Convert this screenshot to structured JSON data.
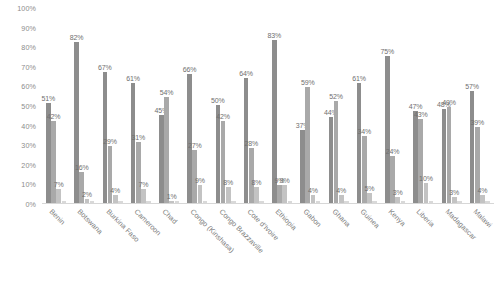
{
  "chart_data": {
    "type": "bar",
    "title": "",
    "subtitle": "",
    "xlabel": "",
    "ylabel": "",
    "ylim": [
      0,
      100
    ],
    "yticks": [
      "0%",
      "10%",
      "20%",
      "30%",
      "40%",
      "50%",
      "60%",
      "70%",
      "80%",
      "90%",
      "100%"
    ],
    "ytick_values": [
      0,
      10,
      20,
      30,
      40,
      50,
      60,
      70,
      80,
      90,
      100
    ],
    "grid": false,
    "legend": "none",
    "value_labels": true,
    "value_label_suffix": "%",
    "categories": [
      "Benin",
      "Botswana",
      "Burkina Faso",
      "Cameroon",
      "Chad",
      "Congo (Kinshasa)",
      "Congo Brazzaville",
      "Cote d'Ivoire",
      "Ethiopia",
      "Gabon",
      "Ghana",
      "Guinea",
      "Kenya",
      "Liberia",
      "Madagascar",
      "Malawi"
    ],
    "series": [
      {
        "name": "Series 1",
        "color": "#8d8d8d",
        "values": [
          51,
          82,
          67,
          61,
          45,
          66,
          50,
          64,
          83,
          37,
          44,
          61,
          75,
          47,
          48,
          57
        ],
        "labels": [
          "51%",
          "82%",
          "67%",
          "61%",
          "45%",
          "66%",
          "50%",
          "64%",
          "83%",
          "37%",
          "44%",
          "61%",
          "75%",
          "47%",
          "48%",
          "57%"
        ]
      },
      {
        "name": "Series 2",
        "color": "#a9a9a9",
        "values": [
          42,
          16,
          29,
          31,
          54,
          27,
          42,
          28,
          9,
          59,
          52,
          34,
          24,
          43,
          49,
          39
        ],
        "labels": [
          "42%",
          "16%",
          "29%",
          "31%",
          "54%",
          "27%",
          "42%",
          "28%",
          "9%",
          "59%",
          "52%",
          "34%",
          "24%",
          "43%",
          "49%",
          "39%"
        ]
      },
      {
        "name": "Series 3",
        "color": "#c3c3c3",
        "values": [
          7,
          2,
          4,
          7,
          1,
          9,
          8,
          8,
          9,
          4,
          4,
          5,
          3,
          10,
          3,
          4
        ],
        "labels": [
          "7%",
          "2%",
          "4%",
          "7%",
          "1%",
          "9%",
          "8%",
          "8%",
          "9%",
          "4%",
          "4%",
          "5%",
          "3%",
          "10%",
          "3%",
          "4%"
        ]
      },
      {
        "name": "Series 4",
        "color": "#d9d9d9",
        "values": [
          1,
          1,
          1,
          1,
          1,
          1,
          1,
          1,
          1,
          1,
          1,
          1,
          1,
          1,
          1,
          1
        ],
        "labels": [
          "",
          "",
          "",
          "",
          "",
          "",
          "",
          "",
          "",
          "",
          "",
          "",
          "",
          "",
          "",
          ""
        ]
      }
    ]
  }
}
